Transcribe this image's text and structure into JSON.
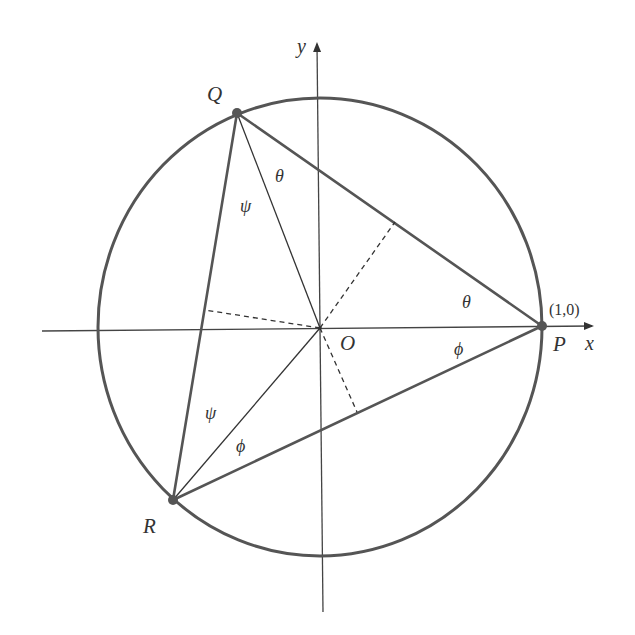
{
  "diagram": {
    "type": "geometry",
    "colors": {
      "circle": "#555555",
      "triangle": "#555555",
      "axes": "#444444",
      "thin_lines": "#333333",
      "points": "#555555",
      "text": "#333333"
    },
    "axes": {
      "x_label": "x",
      "y_label": "y"
    },
    "points": {
      "P": {
        "label": "P",
        "coord_label": "(1,0)"
      },
      "Q": {
        "label": "Q"
      },
      "R": {
        "label": "R"
      },
      "O": {
        "label": "O"
      }
    },
    "angle_labels": {
      "theta_at_Q": "θ",
      "theta_at_P": "θ",
      "phi_at_P": "ϕ",
      "phi_at_R": "ϕ",
      "psi_at_Q": "ψ",
      "psi_at_R": "ψ"
    },
    "segments": [
      "PQ",
      "QR",
      "RP",
      "OQ",
      "OR",
      "OP"
    ],
    "perpendiculars": [
      "O to PQ (dashed)",
      "O to QR (dashed)",
      "O to RP (dashed)"
    ]
  }
}
